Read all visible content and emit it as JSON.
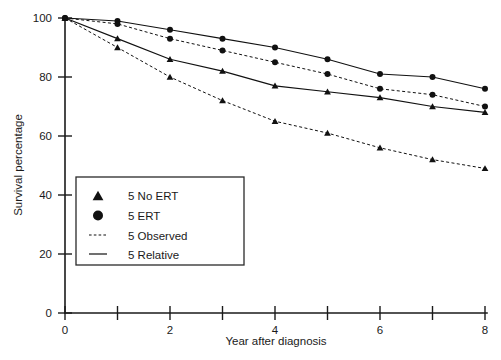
{
  "chart_data": {
    "type": "line",
    "title": "",
    "xlabel": "Year after diagnosis",
    "ylabel": "Survival percentage",
    "xlim": [
      0,
      8
    ],
    "ylim": [
      0,
      100
    ],
    "x_ticks": [
      0,
      1,
      2,
      3,
      4,
      5,
      6,
      7,
      8
    ],
    "x_tick_labels": [
      "0",
      "",
      "2",
      "",
      "4",
      "",
      "6",
      "",
      "8"
    ],
    "y_ticks": [
      0,
      20,
      40,
      60,
      80,
      100
    ],
    "y_tick_labels": [
      "0",
      "20",
      "40",
      "60",
      "80",
      "100"
    ],
    "grid": false,
    "legend_position": "lower-left-inside",
    "x": [
      0,
      1,
      2,
      3,
      4,
      5,
      6,
      7,
      8
    ],
    "series": [
      {
        "name": "5 ERT Relative",
        "marker": "circle",
        "line_style": "solid",
        "values": [
          100,
          99,
          96,
          93,
          90,
          86,
          81,
          80,
          76
        ]
      },
      {
        "name": "5 ERT Observed",
        "marker": "circle",
        "line_style": "dashed",
        "values": [
          100,
          98,
          93,
          89,
          85,
          81,
          76,
          74,
          70
        ]
      },
      {
        "name": "5 No ERT Relative",
        "marker": "triangle",
        "line_style": "solid",
        "values": [
          100,
          93,
          86,
          82,
          77,
          75,
          73,
          70,
          68
        ]
      },
      {
        "name": "5 No ERT Observed",
        "marker": "triangle",
        "line_style": "dashed",
        "values": [
          100,
          90,
          80,
          72,
          65,
          61,
          56,
          52,
          49
        ]
      }
    ],
    "legend_entries": [
      {
        "label": "5 No ERT",
        "swatch": "triangle-marker"
      },
      {
        "label": "5 ERT",
        "swatch": "circle-marker"
      },
      {
        "label": "5 Observed",
        "swatch": "dashed-line"
      },
      {
        "label": "5 Relative",
        "swatch": "solid-line"
      }
    ]
  }
}
